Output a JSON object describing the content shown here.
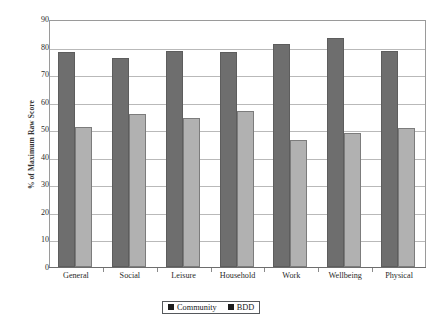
{
  "figure": {
    "caption_fragment": "",
    "background_color": "#ffffff"
  },
  "chart_data": {
    "type": "bar",
    "title": "",
    "xlabel": "",
    "ylabel": "% of Maximum Raw Score",
    "ylim": [
      0,
      90
    ],
    "ytick_step": 10,
    "yticks": [
      0,
      10,
      20,
      30,
      40,
      50,
      60,
      70,
      80,
      90
    ],
    "ytick_labels": [
      "0",
      "10",
      "20",
      "30",
      "40",
      "50",
      "60",
      "70",
      "80",
      "90"
    ],
    "grid": true,
    "grid_axis": "y",
    "legend_position": "bottom-center",
    "categories": [
      "General",
      "Social",
      "Leisure",
      "Household",
      "Work",
      "Wellbeing",
      "Physical"
    ],
    "series": [
      {
        "name": "Community",
        "color": "#6e6e6e",
        "values": [
          78,
          76,
          78.5,
          78,
          81,
          83,
          78.5
        ]
      },
      {
        "name": "BDD",
        "color": "#b1b1b1",
        "values": [
          51,
          55.5,
          54,
          56.5,
          46,
          48.5,
          50.5
        ]
      }
    ]
  },
  "legend": {
    "entries": [
      {
        "label": "Community",
        "swatch_color": "#1d1d1d"
      },
      {
        "label": "BDD",
        "swatch_color": "#1d1d1d"
      }
    ]
  }
}
